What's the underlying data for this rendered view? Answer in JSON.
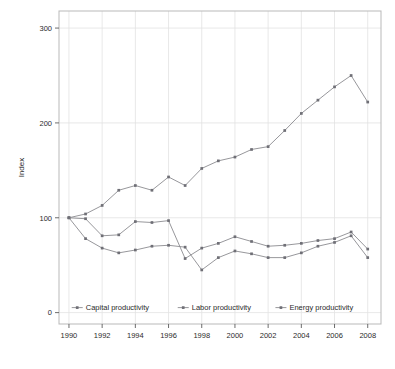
{
  "chart_data": {
    "type": "line",
    "title": "",
    "xlabel": "",
    "ylabel": "Index",
    "xlim": [
      1989.4,
      2008.8
    ],
    "ylim": [
      -12,
      318
    ],
    "grid": true,
    "legend_position": "inside-bottom-center",
    "x": [
      1990,
      1991,
      1992,
      1993,
      1994,
      1995,
      1996,
      1997,
      1998,
      1999,
      2000,
      2001,
      2002,
      2003,
      2004,
      2005,
      2006,
      2007,
      2008
    ],
    "xticks": [
      1990,
      1992,
      1994,
      1996,
      1998,
      2000,
      2002,
      2004,
      2006,
      2008
    ],
    "xtick_labels": [
      "1990",
      "1992",
      "1994",
      "1996",
      "1998",
      "2000",
      "2002",
      "2004",
      "2006",
      "2008"
    ],
    "yticks": [
      0,
      100,
      200,
      300
    ],
    "ytick_labels": [
      "0",
      "100",
      "200",
      "300"
    ],
    "series": [
      {
        "name": "Capital productivity",
        "marker": "point",
        "color": "#6f6f76",
        "values": [
          100,
          99,
          81,
          82,
          96,
          95,
          97,
          57,
          68,
          73,
          80,
          75,
          70,
          71,
          73,
          76,
          78,
          85,
          67
        ]
      },
      {
        "name": "Labor productivity",
        "marker": "point",
        "color": "#6f6f76",
        "values": [
          100,
          78,
          68,
          63,
          66,
          70,
          71,
          69,
          45,
          58,
          65,
          62,
          58,
          58,
          63,
          70,
          74,
          81,
          58
        ]
      },
      {
        "name": "Energy productivity",
        "marker": "point",
        "color": "#6f6f76",
        "values": [
          100,
          104,
          113,
          129,
          134,
          129,
          143,
          134,
          152,
          160,
          164,
          172,
          175,
          192,
          210,
          224,
          238,
          250,
          222
        ]
      }
    ]
  },
  "legend": {
    "items": [
      {
        "label": "Capital productivity"
      },
      {
        "label": "Labor productivity"
      },
      {
        "label": "Energy productivity"
      }
    ]
  },
  "axes": {
    "y_title": "Index"
  }
}
